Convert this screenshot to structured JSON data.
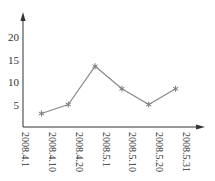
{
  "chart_data": {
    "type": "line",
    "title": "",
    "xlabel": "",
    "ylabel": "",
    "x_tick_labels": [
      "2008.4.1",
      "2008.4.10",
      "2008.4.20",
      "2008.5.1",
      "2008.5.10",
      "2008.5.20",
      "2008.5.31"
    ],
    "y_ticks": [
      5,
      10,
      15,
      20
    ],
    "ylim": [
      0,
      23
    ],
    "grid": false,
    "legend": null,
    "marker": "asterisk",
    "series": [
      {
        "name": "",
        "values": [
          3,
          5,
          13.5,
          8.5,
          5,
          8.5
        ]
      }
    ],
    "point_x_positions_note": "6 points plotted between adjacent x tick labels (interval midpoints); exact period mapping not labeled"
  },
  "colors": {
    "axis": "#333333",
    "line": "#8a8a8a",
    "background": "#ffffff"
  }
}
